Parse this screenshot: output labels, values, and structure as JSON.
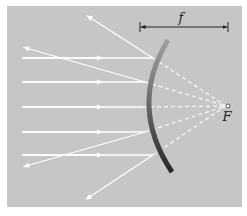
{
  "diagram": {
    "labels": {
      "focal_length": "f",
      "focal_point": "F"
    },
    "colors": {
      "background": "#c4c4c4",
      "rays": "#ffffff",
      "mirror_top": "#9a9a9a",
      "mirror_bottom": "#2a2a2a",
      "dimension_line": "#222222"
    },
    "mirror": {
      "top": [
        168,
        40
      ],
      "apex": [
        143,
        107
      ],
      "bottom": [
        172,
        172
      ]
    },
    "focal_point": [
      228,
      106
    ],
    "rays": [
      {
        "incoming_y": 58,
        "hit": [
          153,
          58
        ],
        "reflected_end": [
          88,
          16
        ]
      },
      {
        "incoming_y": 82,
        "hit": [
          145,
          82
        ],
        "reflected_end": [
          24,
          48
        ]
      },
      {
        "incoming_y": 107,
        "hit": [
          143,
          107
        ],
        "reflected_end": [
          22,
          107
        ]
      },
      {
        "incoming_y": 132,
        "hit": [
          145,
          132
        ],
        "reflected_end": [
          25,
          167
        ]
      },
      {
        "incoming_y": 155,
        "hit": [
          153,
          155
        ],
        "reflected_end": [
          87,
          199
        ]
      }
    ]
  }
}
